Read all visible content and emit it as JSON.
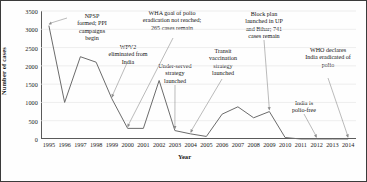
{
  "chart_data": {
    "type": "line",
    "title": "",
    "xlabel": "Year",
    "ylabel": "Number of cases",
    "x": [
      1995,
      1996,
      1997,
      1998,
      1999,
      2000,
      2001,
      2002,
      2003,
      2004,
      2005,
      2006,
      2007,
      2008,
      2009,
      2010,
      2011,
      2012,
      2013,
      2014
    ],
    "categories": [
      "1995",
      "1996",
      "1997",
      "1998",
      "1999",
      "2000",
      "2001",
      "2002",
      "2003",
      "2004",
      "2005",
      "2006",
      "2007",
      "2008",
      "2009",
      "2010",
      "2011",
      "2012",
      "2013",
      "2014"
    ],
    "values": [
      3100,
      1000,
      2250,
      2100,
      1100,
      290,
      290,
      1600,
      230,
      140,
      70,
      680,
      880,
      580,
      750,
      40,
      0,
      0,
      0,
      0
    ],
    "series": [
      {
        "name": "Polio cases in India",
        "values": [
          3100,
          1000,
          2250,
          2100,
          1100,
          290,
          290,
          1600,
          230,
          140,
          70,
          680,
          880,
          580,
          750,
          40,
          0,
          0,
          0,
          0
        ]
      }
    ],
    "ylim": [
      0,
      3500
    ],
    "ytick_values": [
      0,
      500,
      1000,
      1500,
      2000,
      2500,
      3000,
      3500
    ],
    "ytick_labels": [
      "0",
      "500",
      "1000",
      "1500",
      "2000",
      "2500",
      "3000",
      "3500"
    ],
    "xlim": [
      1995,
      2014
    ],
    "grid": true,
    "legend": "none",
    "line_color": "#6b6b6b",
    "annotations": [
      {
        "id": "npsp",
        "text": "NPSP\nformed; PPI\ncampaigns\nbegin",
        "target_year": 1995,
        "target_value": 3100
      },
      {
        "id": "wpv2",
        "text": "WPV2\neliminated from\nIndia",
        "target_year": 1999,
        "target_value": 1100
      },
      {
        "id": "wha",
        "text": "WHA goal of polio\neradication not reached;\n265 cases remain",
        "target_year": 2000,
        "target_value": 265
      },
      {
        "id": "under-served",
        "text": "Under-served\nstrategy\nlaunched",
        "target_year": 2003,
        "target_value": 230
      },
      {
        "id": "transit",
        "text": "Transit\nvaccination\nstrategy\nlaunched",
        "target_year": 2004,
        "target_value": 140
      },
      {
        "id": "block-plan",
        "text": "Block plan\nlaunched in UP\nand Bihar; 741\ncases remain",
        "target_year": 2009,
        "target_value": 741
      },
      {
        "id": "polio-free",
        "text": "India is\npolio-free",
        "target_year": 2012,
        "target_value": 0
      },
      {
        "id": "who-declares",
        "text": "WHO declares\nIndia eradicated of\npolio",
        "target_year": 2014,
        "target_value": 0
      }
    ]
  },
  "axes": {
    "y_title": "Number of cases",
    "x_title": "Year",
    "y_ticks": [
      "3500",
      "3000",
      "2500",
      "2000",
      "1500",
      "1000",
      "500",
      "0"
    ],
    "x_ticks": [
      "1995",
      "1996",
      "1997",
      "1998",
      "1999",
      "2000",
      "2001",
      "2002",
      "2003",
      "2004",
      "2005",
      "2006",
      "2007",
      "2008",
      "2009",
      "2010",
      "2011",
      "2012",
      "2013",
      "2014"
    ]
  },
  "annotations": {
    "npsp": "NPSP\nformed; PPI\ncampaigns\nbegin",
    "wpv2": "WPV2\neliminated from\nIndia",
    "wha": "WHA goal of polio\neradication not reached;\n265 cases remain",
    "under_served": "Under-served\nstrategy\nlaunched",
    "transit": "Transit\nvaccination\nstrategy\nlaunched",
    "block_plan": "Block plan\nlaunched in UP\nand Bihar; 741\ncases remain",
    "polio_free": "India is\npolio-free",
    "who_declares": "WHO declares\nIndia eradicated of\npolio"
  }
}
